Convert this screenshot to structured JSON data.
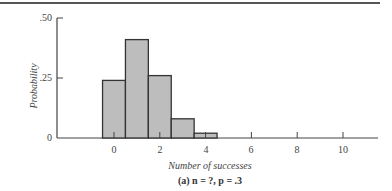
{
  "chart_data": {
    "type": "bar",
    "title": "",
    "caption": "(a) n = ?, p = .3",
    "xlabel": "Number of successes",
    "ylabel": "Probability",
    "categories": [
      0,
      1,
      2,
      3,
      4
    ],
    "values": [
      0.24,
      0.41,
      0.26,
      0.08,
      0.02
    ],
    "xticks": [
      "0",
      "2",
      "4",
      "6",
      "8",
      "10"
    ],
    "yticks": [
      ".50",
      ".25",
      "0"
    ],
    "ylim": [
      0,
      0.5
    ],
    "xlim": [
      -2.5,
      11.5
    ],
    "grid": false,
    "bar_color": "#bdbdbd",
    "edge_color": "#333333"
  },
  "labels": {
    "ylabel": "Probability",
    "xlabel": "Number of successes",
    "caption": "(a) n = ?, p = .3",
    "ytick_50": ".50",
    "ytick_25": ".25",
    "ytick_0": "0",
    "xtick_0": "0",
    "xtick_2": "2",
    "xtick_4": "4",
    "xtick_6": "6",
    "xtick_8": "8",
    "xtick_10": "10"
  }
}
